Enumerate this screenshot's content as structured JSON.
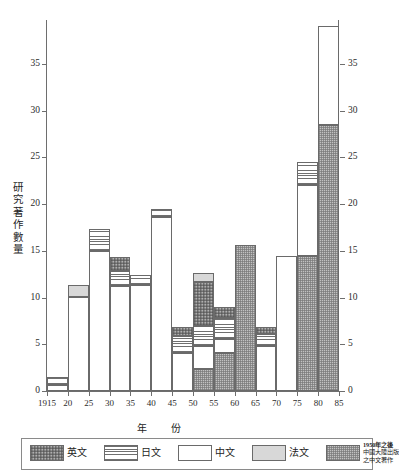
{
  "chart_data": {
    "type": "bar",
    "subtype": "stacked",
    "title": "",
    "xlabel": "年　份",
    "ylabel": "研究著作數量",
    "ylim": [
      0,
      39.5
    ],
    "yticks": [
      0,
      5,
      10,
      15,
      20,
      25,
      30,
      35
    ],
    "ytick_labels": [
      "0",
      "5",
      "10",
      "15",
      "20",
      "25",
      "30",
      "35"
    ],
    "right_axis": true,
    "grid": false,
    "legend_position": "bottom",
    "xtick_labels": [
      "1915",
      "20",
      "25",
      "30",
      "35",
      "40",
      "45",
      "50",
      "55",
      "60",
      "65",
      "70",
      "75",
      "80",
      "85"
    ],
    "categories": [
      "1915-20",
      "20-25",
      "25-30",
      "30-35",
      "35-40",
      "40-45",
      "45-50",
      "50-55",
      "55-60",
      "60-65",
      "65-70",
      "70-75",
      "75-80",
      "80-85"
    ],
    "series": [
      {
        "name": "中文",
        "key": "zh",
        "fill": "white",
        "color": "#ffffff",
        "values": [
          0.6,
          10.1,
          15.0,
          11.2,
          11.3,
          18.6,
          4.1,
          2.4,
          1.5,
          0.0,
          4.8,
          14.5,
          7.5,
          10.6
        ]
      },
      {
        "name": "日文",
        "key": "jp",
        "fill": "horizontal-lines",
        "color": "#ffffff",
        "values": [
          0.9,
          0.0,
          2.3,
          1.6,
          1.1,
          0.9,
          1.8,
          2.2,
          2.2,
          0.0,
          1.3,
          0.0,
          2.5,
          0.0
        ]
      },
      {
        "name": "英文",
        "key": "en",
        "fill": "dark-checker",
        "color": "#d3d3d3",
        "values": [
          0.0,
          0.0,
          0.0,
          1.5,
          0.0,
          0.0,
          0.9,
          4.7,
          1.2,
          0.0,
          0.7,
          0.0,
          0.0,
          0.0
        ]
      },
      {
        "name": "法文",
        "key": "fr",
        "fill": "light-gray",
        "color": "#d8d8d8",
        "values": [
          0.0,
          1.2,
          0.0,
          0.0,
          0.0,
          0.0,
          0.0,
          0.9,
          0.0,
          0.0,
          0.0,
          0.0,
          0.0,
          0.0
        ]
      },
      {
        "name": "1950年之後中國大陸出版之中文著作",
        "key": "prc",
        "fill": "gray-speckle",
        "color": "#c2c2c2",
        "values": [
          0.0,
          0.0,
          0.0,
          0.0,
          0.0,
          0.0,
          0.0,
          2.4,
          4.1,
          15.6,
          0.0,
          0.0,
          14.5,
          28.5
        ]
      }
    ],
    "totals": [
      1.5,
      11.3,
      17.3,
      14.3,
      12.4,
      19.5,
      6.8,
      13.4,
      9.0,
      15.6,
      6.8,
      14.5,
      24.5,
      39.1
    ],
    "stack_order": [
      "prc",
      "zh",
      "jp",
      "en",
      "fr"
    ]
  },
  "axes": {
    "y_title_chars": [
      "研",
      "究",
      "著",
      "作",
      "數",
      "量"
    ],
    "x_title": "年　份"
  },
  "legend": {
    "items": [
      {
        "label": "英文",
        "key": "en",
        "multiline": false
      },
      {
        "label": "日文",
        "key": "jp",
        "multiline": false
      },
      {
        "label": "中文",
        "key": "zh",
        "multiline": false
      },
      {
        "label": "法文",
        "key": "fr",
        "multiline": false
      },
      {
        "label": "1950年之後中國大陸出版之中文著作",
        "key": "prc",
        "multiline": true,
        "lines": [
          "1950年之後",
          "中國大陸出版",
          "之中文著作"
        ]
      }
    ]
  },
  "colors": {
    "axis": "#6e6e6e",
    "text": "#1d1d1d",
    "en": "#d3d3d3",
    "jp": "#ffffff",
    "zh": "#ffffff",
    "fr": "#d8d8d8",
    "prc": "#c2c2c2"
  }
}
